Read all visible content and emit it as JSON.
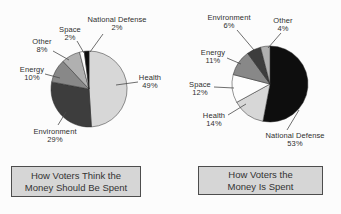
{
  "page": {
    "background": "#fcfcfc",
    "text_color": "#2f2f2f"
  },
  "caption_style": {
    "fill": "#d6d6d6",
    "border": "#4d4d4d"
  },
  "chart_data": [
    {
      "type": "pie",
      "title": "How Voters Think the Money Should Be Spent",
      "title_line1": "How Voters Think the",
      "title_line2": "Money Should Be Spent",
      "start_angle": "12 o'clock",
      "direction": "clockwise",
      "labels": "outside-callouts",
      "slices": [
        {
          "label": "Health",
          "value": 49,
          "pct": "49%",
          "color": "#d7d7d7"
        },
        {
          "label": "Environment",
          "value": 29,
          "pct": "29%",
          "color": "#3d3d3d"
        },
        {
          "label": "Energy",
          "value": 10,
          "pct": "10%",
          "color": "#888888"
        },
        {
          "label": "Other",
          "value": 8,
          "pct": "8%",
          "color": "#b0b0b0"
        },
        {
          "label": "Space",
          "value": 2,
          "pct": "2%",
          "color": "#fdfdfd"
        },
        {
          "label": "National Defense",
          "value": 2,
          "pct": "2%",
          "color": "#0e0e0e"
        }
      ]
    },
    {
      "type": "pie",
      "title": "How Voters the Money Is Spent",
      "title_line1": "How Voters the",
      "title_line2": "Money Is Spent",
      "start_angle": "12 o'clock",
      "direction": "clockwise",
      "labels": "outside-callouts",
      "slices": [
        {
          "label": "National Defense",
          "value": 53,
          "pct": "53%",
          "color": "#0e0e0e"
        },
        {
          "label": "Health",
          "value": 14,
          "pct": "14%",
          "color": "#d7d7d7"
        },
        {
          "label": "Space",
          "value": 12,
          "pct": "12%",
          "color": "#fdfdfd"
        },
        {
          "label": "Energy",
          "value": 11,
          "pct": "11%",
          "color": "#888888"
        },
        {
          "label": "Environment",
          "value": 6,
          "pct": "6%",
          "color": "#3d3d3d"
        },
        {
          "label": "Other",
          "value": 4,
          "pct": "4%",
          "color": "#b0b0b0"
        }
      ]
    }
  ]
}
